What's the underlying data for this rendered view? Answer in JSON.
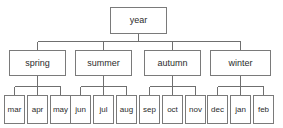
{
  "diagram": {
    "title": "year",
    "type": "tree",
    "orientation": "top-down",
    "levels": 3,
    "colors": {
      "background": "#ffffff",
      "node_fill": "#ffffff",
      "node_border": "#7a7a7a",
      "edge": "#6f6f6f",
      "text": "#2b2b2b"
    },
    "root": {
      "label": "year"
    },
    "seasons": [
      {
        "label": "spring",
        "months": [
          "mar",
          "apr",
          "may"
        ]
      },
      {
        "label": "summer",
        "months": [
          "jun",
          "jul",
          "aug"
        ]
      },
      {
        "label": "autumn",
        "months": [
          "sep",
          "oct",
          "nov"
        ]
      },
      {
        "label": "winter",
        "months": [
          "dec",
          "jan",
          "feb"
        ]
      }
    ],
    "months_flat": [
      "mar",
      "apr",
      "may",
      "jun",
      "jul",
      "aug",
      "sep",
      "oct",
      "nov",
      "dec",
      "jan",
      "feb"
    ]
  }
}
